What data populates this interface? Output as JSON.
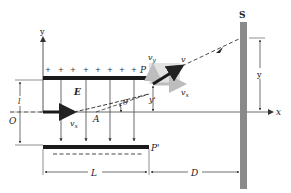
{
  "diagram": {
    "labels": {
      "y_axis": "y",
      "x_axis": "x",
      "origin": "O",
      "field": "E",
      "plate_top": "P",
      "plate_bottom": "P'",
      "screen": "S",
      "point_a": "A",
      "angle": "θ",
      "velocity": "v",
      "vx_initial": "v",
      "vx_initial_sub": "x",
      "vx_exit": "v",
      "vx_exit_sub": "x",
      "vy_exit": "v",
      "vy_exit_sub": "y",
      "y_prime": "y'",
      "y_screen": "y",
      "plate_gap": "l",
      "plate_length": "L",
      "distance_to_screen": "D",
      "plus_sign": "+"
    },
    "plus_count": 8,
    "field_arrow_count": 4,
    "colors": {
      "plate": "#1a1a1a",
      "screen": "#8a8a8a",
      "velocity_component": "#bdbdbd",
      "vector_box": "#e2e2e2",
      "line": "#333333"
    }
  }
}
